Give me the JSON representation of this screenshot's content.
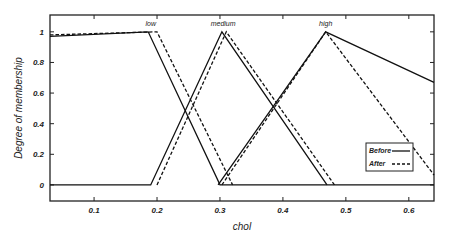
{
  "chart_data": {
    "type": "line",
    "title": "",
    "xlabel": "chol",
    "ylabel": "Degree of membership",
    "xlim": [
      0.03,
      0.64
    ],
    "ylim": [
      -0.105,
      1.11
    ],
    "xticks": [
      0.1,
      0.2,
      0.3,
      0.4,
      0.5,
      0.6
    ],
    "xtick_labels": [
      "0.1",
      "0.2",
      "0.3",
      "0.4",
      "0.5",
      "0.6"
    ],
    "yticks": [
      0,
      0.2,
      0.4,
      0.6,
      0.8,
      1
    ],
    "ytick_labels": [
      "0",
      "0.2",
      "0.4",
      "0.6",
      "0.8",
      "1"
    ],
    "grid": false,
    "legend": {
      "position": "lower right",
      "entries": [
        {
          "label": "Before",
          "style": "solid"
        },
        {
          "label": "After",
          "style": "dashed"
        }
      ]
    },
    "annotations": [
      {
        "text": "low",
        "x": 0.19,
        "y": 1.04
      },
      {
        "text": "medium",
        "x": 0.305,
        "y": 1.04
      },
      {
        "text": "high",
        "x": 0.468,
        "y": 1.04
      }
    ],
    "series": [
      {
        "name": "low (Before)",
        "style": "solid",
        "points": [
          [
            0.03,
            0.97
          ],
          [
            0.186,
            1.0
          ],
          [
            0.3,
            0.0
          ],
          [
            0.64,
            0.0
          ]
        ]
      },
      {
        "name": "low (After)",
        "style": "dashed",
        "points": [
          [
            0.03,
            0.98
          ],
          [
            0.2,
            1.0
          ],
          [
            0.32,
            0.0
          ]
        ]
      },
      {
        "name": "medium (Before)",
        "style": "solid",
        "points": [
          [
            0.03,
            0.0
          ],
          [
            0.19,
            0.0
          ],
          [
            0.303,
            1.0
          ],
          [
            0.47,
            0.0
          ]
        ]
      },
      {
        "name": "medium (After)",
        "style": "dashed",
        "points": [
          [
            0.2,
            0.0
          ],
          [
            0.31,
            1.0
          ],
          [
            0.482,
            0.0
          ]
        ]
      },
      {
        "name": "high (Before)",
        "style": "solid",
        "points": [
          [
            0.297,
            0.0
          ],
          [
            0.468,
            1.0
          ],
          [
            0.64,
            0.67
          ]
        ]
      },
      {
        "name": "high (After)",
        "style": "dashed",
        "points": [
          [
            0.303,
            0.0
          ],
          [
            0.468,
            1.0
          ],
          [
            0.64,
            0.065
          ]
        ]
      }
    ]
  },
  "colors": {
    "line": "#111111",
    "axis": "#222222",
    "background": "#ffffff"
  }
}
